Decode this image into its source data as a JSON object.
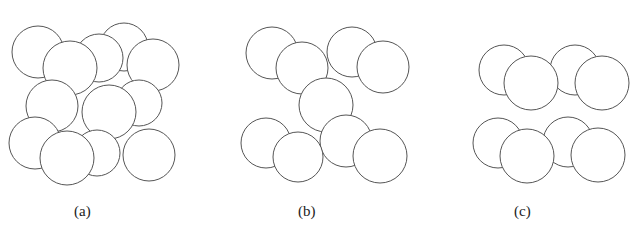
{
  "figure": {
    "stroke_color": "#555555",
    "fill_color": "#ffffff",
    "panels": [
      {
        "id": "a",
        "caption": "(a)",
        "caption_pos": [
          74,
          216
        ],
        "circles": [
          [
            38,
            52,
            26
          ],
          [
            124,
            47,
            24
          ],
          [
            99,
            58,
            24
          ],
          [
            153,
            65,
            26
          ],
          [
            70,
            68,
            27
          ],
          [
            139,
            103,
            23
          ],
          [
            52,
            106,
            26
          ],
          [
            109,
            112,
            27
          ],
          [
            35,
            143,
            26
          ],
          [
            97,
            153,
            23
          ],
          [
            149,
            155,
            26
          ],
          [
            67,
            158,
            27
          ]
        ]
      },
      {
        "id": "b",
        "caption": "(b)",
        "caption_pos": [
          298,
          216
        ],
        "circles": [
          [
            272,
            53,
            26
          ],
          [
            352,
            52,
            25
          ],
          [
            302,
            68,
            26
          ],
          [
            383,
            67,
            26
          ],
          [
            326,
            105,
            27
          ],
          [
            266,
            143,
            25
          ],
          [
            346,
            141,
            26
          ],
          [
            298,
            157,
            25
          ],
          [
            380,
            156,
            27
          ]
        ]
      },
      {
        "id": "c",
        "caption": "(c)",
        "caption_pos": [
          514,
          216
        ],
        "circles": [
          [
            504,
            70,
            25
          ],
          [
            575,
            70,
            25
          ],
          [
            531,
            83,
            27
          ],
          [
            602,
            83,
            27
          ],
          [
            498,
            143,
            25
          ],
          [
            568,
            142,
            25
          ],
          [
            527,
            156,
            27
          ],
          [
            598,
            155,
            27
          ]
        ]
      }
    ]
  }
}
